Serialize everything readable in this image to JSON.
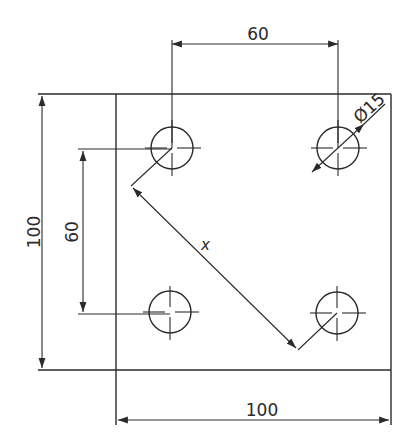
{
  "drawing": {
    "type": "engineering plate drawing with four holes",
    "plate": {
      "width_label": "100",
      "height_label": "100"
    },
    "hole_spacing": {
      "horizontal_label": "60",
      "vertical_label": "60"
    },
    "hole_diameter_label": "Ø15",
    "diagonal_label": "x",
    "holes": [
      {
        "name": "top-left",
        "cx": 172,
        "cy": 148
      },
      {
        "name": "top-right",
        "cx": 338,
        "cy": 148
      },
      {
        "name": "bottom-left",
        "cx": 170,
        "cy": 312
      },
      {
        "name": "bottom-right",
        "cx": 337,
        "cy": 313
      }
    ],
    "line_color": "#2a2a2a",
    "background": "#ffffff"
  }
}
